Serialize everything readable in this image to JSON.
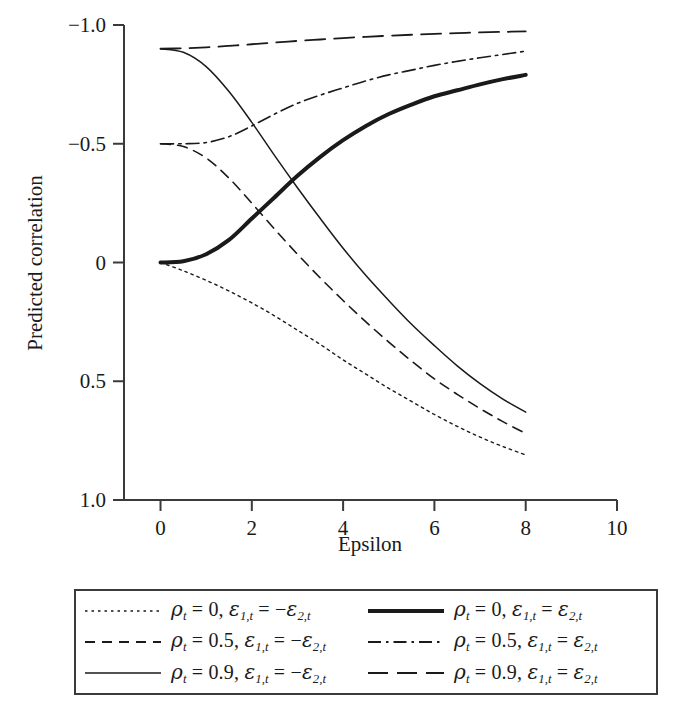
{
  "figure": {
    "background_color": "#ffffff",
    "line_color": "#1a1a1a",
    "axis_color": "#3a3a3a"
  },
  "axes": {
    "x_title": "Epsilon",
    "y_title": "Predicted correlation",
    "x_ticks": [
      "0",
      "2",
      "4",
      "6",
      "8",
      "10"
    ],
    "y_ticks": [
      "1.0",
      "0.5",
      "0",
      "−0.5",
      "−1.0"
    ]
  },
  "legend": {
    "entries": [
      {
        "key": "rho0-neg",
        "style": "dotted",
        "rho_symbol": "ρ",
        "rho_sub": "t",
        "rho_value": "0",
        "eps_symbol": "ε",
        "eps1_sub": "1,t",
        "eps2_sub": "2,t",
        "sign": "−",
        "text": "ρt = 0, ε1,t = −ε2,t"
      },
      {
        "key": "rho0-pos",
        "style": "thick-solid",
        "rho_symbol": "ρ",
        "rho_sub": "t",
        "rho_value": "0",
        "eps_symbol": "ε",
        "eps1_sub": "1,t",
        "eps2_sub": "2,t",
        "sign": "",
        "text": "ρt = 0, ε1,t = ε2,t"
      },
      {
        "key": "rho05-neg",
        "style": "dashed",
        "rho_symbol": "ρ",
        "rho_sub": "t",
        "rho_value": "0.5",
        "eps_symbol": "ε",
        "eps1_sub": "1,t",
        "eps2_sub": "2,t",
        "sign": "−",
        "text": "ρt = 0.5, ε1,t = −ε2,t"
      },
      {
        "key": "rho05-pos",
        "style": "dash-dot",
        "rho_symbol": "ρ",
        "rho_sub": "t",
        "rho_value": "0.5",
        "eps_symbol": "ε",
        "eps1_sub": "1,t",
        "eps2_sub": "2,t",
        "sign": "",
        "text": "ρt = 0.5, ε1,t = ε2,t"
      },
      {
        "key": "rho09-neg",
        "style": "thin-solid",
        "rho_symbol": "ρ",
        "rho_sub": "t",
        "rho_value": "0.9",
        "eps_symbol": "ε",
        "eps1_sub": "1,t",
        "eps2_sub": "2,t",
        "sign": "−",
        "text": "ρt = 0.9, ε1,t = −ε2,t"
      },
      {
        "key": "rho09-pos",
        "style": "long-dash",
        "rho_symbol": "ρ",
        "rho_sub": "t",
        "rho_value": "0.9",
        "eps_symbol": "ε",
        "eps1_sub": "1,t",
        "eps2_sub": "2,t",
        "sign": "",
        "text": "ρt = 0.9, ε1,t = ε2,t"
      }
    ]
  },
  "chart_data": {
    "type": "line",
    "title": "",
    "xlabel": "Epsilon",
    "ylabel": "Predicted correlation",
    "xlim": [
      -0.8,
      10
    ],
    "ylim": [
      -1.0,
      1.0
    ],
    "xticks": [
      0,
      2,
      4,
      6,
      8,
      10
    ],
    "yticks": [
      -1.0,
      -0.5,
      0,
      0.5,
      1.0
    ],
    "grid": false,
    "legend_position": "below-plot",
    "x": [
      0,
      0.5,
      1,
      1.5,
      2,
      2.5,
      3,
      3.5,
      4,
      4.5,
      5,
      5.5,
      6,
      6.5,
      7,
      7.5,
      8
    ],
    "series": [
      {
        "name": "ρt = 0, ε1,t = −ε2,t",
        "style": "dotted",
        "width": 1.4,
        "values": [
          0.0,
          -0.035,
          -0.075,
          -0.12,
          -0.17,
          -0.225,
          -0.285,
          -0.345,
          -0.41,
          -0.47,
          -0.53,
          -0.585,
          -0.64,
          -0.69,
          -0.735,
          -0.775,
          -0.81
        ]
      },
      {
        "name": "ρt = 0, ε1,t = ε2,t",
        "style": "thick-solid",
        "width": 4.0,
        "values": [
          0.0,
          0.005,
          0.035,
          0.095,
          0.185,
          0.275,
          0.365,
          0.445,
          0.515,
          0.575,
          0.625,
          0.665,
          0.7,
          0.725,
          0.75,
          0.772,
          0.79
        ]
      },
      {
        "name": "ρt = 0.5, ε1,t = −ε2,t",
        "style": "dashed",
        "width": 1.6,
        "values": [
          0.5,
          0.488,
          0.44,
          0.355,
          0.25,
          0.14,
          0.035,
          -0.065,
          -0.16,
          -0.25,
          -0.335,
          -0.415,
          -0.49,
          -0.555,
          -0.615,
          -0.67,
          -0.72
        ]
      },
      {
        "name": "ρt = 0.5, ε1,t = ε2,t",
        "style": "dash-dot",
        "width": 1.6,
        "values": [
          0.5,
          0.5,
          0.505,
          0.53,
          0.575,
          0.625,
          0.67,
          0.705,
          0.735,
          0.765,
          0.79,
          0.81,
          0.83,
          0.847,
          0.862,
          0.876,
          0.89
        ]
      },
      {
        "name": "ρt = 0.9, ε1,t = −ε2,t",
        "style": "thin-solid",
        "width": 1.5,
        "values": [
          0.9,
          0.885,
          0.825,
          0.72,
          0.59,
          0.45,
          0.315,
          0.185,
          0.06,
          -0.055,
          -0.16,
          -0.26,
          -0.35,
          -0.435,
          -0.51,
          -0.575,
          -0.63
        ]
      },
      {
        "name": "ρt = 0.9, ε1,t = ε2,t",
        "style": "long-dash",
        "width": 1.8,
        "values": [
          0.9,
          0.902,
          0.906,
          0.912,
          0.919,
          0.926,
          0.933,
          0.939,
          0.945,
          0.95,
          0.955,
          0.959,
          0.963,
          0.966,
          0.969,
          0.971,
          0.973
        ]
      }
    ]
  }
}
